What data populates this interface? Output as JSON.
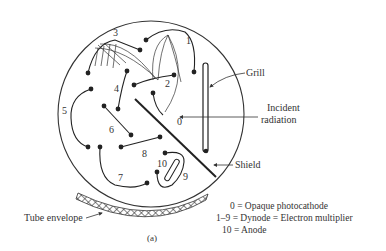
{
  "diagram": {
    "type": "photomultiplier-tube-cross-section",
    "caption": "(a)",
    "electrode_numbers": [
      "0",
      "1",
      "2",
      "3",
      "4",
      "5",
      "6",
      "7",
      "8",
      "9",
      "10"
    ],
    "callouts": {
      "grill": "Grill",
      "incident_line1": "Incident",
      "incident_line2": "radiation",
      "shield": "Shield",
      "envelope": "Tube envelope"
    },
    "legend": [
      {
        "key": "0",
        "text": "0 = Opaque photocathode"
      },
      {
        "key": "1-9",
        "text": "1–9 = Dynode = Electron multiplier"
      },
      {
        "key": "10",
        "text": "10 = Anode"
      }
    ]
  }
}
